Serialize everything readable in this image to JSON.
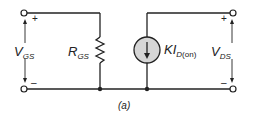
{
  "diagram": {
    "type": "circuit-schematic",
    "caption": "(a)",
    "labels": {
      "vgs": {
        "main": "V",
        "sub": "GS"
      },
      "rgs": {
        "main": "R",
        "sub": "GS"
      },
      "source": {
        "main": "KI",
        "sub": "D",
        "sub2": "(on)"
      },
      "vds": {
        "main": "V",
        "sub": "DS"
      }
    },
    "signs": {
      "left_plus": "+",
      "left_minus": "–",
      "right_plus": "+",
      "right_minus": "–"
    },
    "components": [
      {
        "id": "input-port",
        "kind": "terminal-pair",
        "label": "V_GS"
      },
      {
        "id": "resistor",
        "kind": "resistor",
        "label": "R_GS"
      },
      {
        "id": "current-source",
        "kind": "dependent-current-source",
        "label": "KI_D(on)",
        "direction": "down"
      },
      {
        "id": "output-port",
        "kind": "terminal-pair",
        "label": "V_DS"
      }
    ],
    "colors": {
      "wire": "#222222",
      "source_fill": "#d6d6d6"
    }
  }
}
